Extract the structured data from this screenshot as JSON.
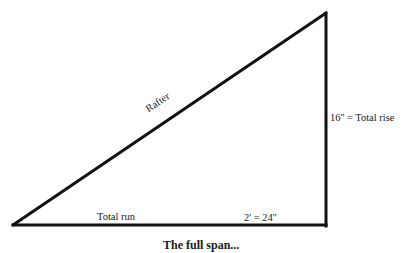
{
  "diagram": {
    "type": "right-triangle",
    "stroke_color": "#111111",
    "stroke_width": 3,
    "vertices": {
      "bottom_left": [
        13,
        225
      ],
      "bottom_right": [
        326,
        225
      ],
      "top_right": [
        326,
        13
      ]
    }
  },
  "labels": {
    "hypotenuse": "Rafter",
    "vertical": "16'' = Total rise",
    "horizontal_name": "Total run",
    "horizontal_value": "2' = 24''"
  },
  "caption": {
    "text": "The full span..."
  }
}
